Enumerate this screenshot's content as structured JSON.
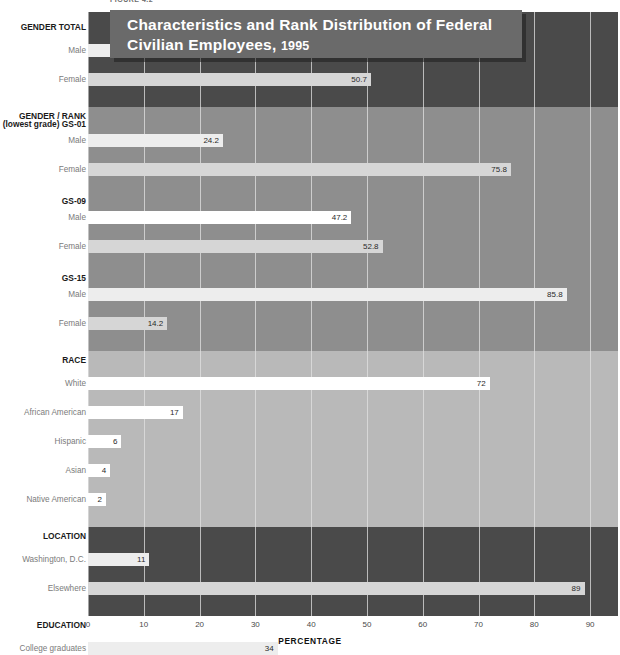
{
  "figure": {
    "label": "FIGURE 4.2",
    "title_line1": "Characteristics and Rank Distribution of Federal",
    "title_line2": "Civilian Employees,",
    "title_year": "1995"
  },
  "axis": {
    "title": "PERCENTAGE",
    "ticks": [
      "0",
      "10",
      "20",
      "30",
      "40",
      "50",
      "60",
      "70",
      "80",
      "90"
    ],
    "min": 0,
    "max": 95
  },
  "colors": {
    "band_dark": "#4a4a4a",
    "band_medium": "#8e8e8e",
    "band_light": "#b9b9b9",
    "bar_light": "#ededed",
    "bar_white": "#ffffff",
    "bar_pale": "#d6d6d6",
    "title_banner": "#6a6a6a",
    "title_text": "#ffffff",
    "label_text": "#7b7b7b",
    "group_text": "#1a1a1a"
  },
  "chart_data": {
    "type": "bar",
    "orientation": "horizontal",
    "title": "Characteristics and Rank Distribution of Federal Civilian Employees, 1995",
    "xlabel": "PERCENTAGE",
    "ylabel": "",
    "xlim": [
      0,
      95
    ],
    "grid": true,
    "legend": "none",
    "xticks": [
      0,
      10,
      20,
      30,
      40,
      50,
      60,
      70,
      80,
      90
    ],
    "groups": [
      {
        "name": "GENDER TOTAL",
        "band": "dark",
        "rows": [
          {
            "label": "Male",
            "value": 49.3,
            "display": "49.3",
            "shade": "light"
          },
          {
            "label": "Female",
            "value": 50.7,
            "display": "50.7",
            "shade": "pale"
          }
        ]
      },
      {
        "name": "GENDER / RANK",
        "band": "medium",
        "subgroups": [
          {
            "name": "(lowest grade) GS-01",
            "rows": [
              {
                "label": "Male",
                "value": 24.2,
                "display": "24.2",
                "shade": "light"
              },
              {
                "label": "Female",
                "value": 75.8,
                "display": "75.8",
                "shade": "pale"
              }
            ]
          },
          {
            "name": "GS-09",
            "rows": [
              {
                "label": "Male",
                "value": 47.2,
                "display": "47.2",
                "shade": "white"
              },
              {
                "label": "Female",
                "value": 52.8,
                "display": "52.8",
                "shade": "pale"
              }
            ]
          },
          {
            "name": "GS-15",
            "rows": [
              {
                "label": "Male",
                "value": 85.8,
                "display": "85.8",
                "shade": "light"
              },
              {
                "label": "Female",
                "value": 14.2,
                "display": "14.2",
                "shade": "pale"
              }
            ]
          }
        ]
      },
      {
        "name": "RACE",
        "band": "light",
        "rows": [
          {
            "label": "White",
            "value": 72,
            "display": "72",
            "shade": "white"
          },
          {
            "label": "African American",
            "value": 17,
            "display": "17",
            "shade": "white"
          },
          {
            "label": "Hispanic",
            "value": 6,
            "display": "6",
            "shade": "white"
          },
          {
            "label": "Asian",
            "value": 4,
            "display": "4",
            "shade": "white"
          },
          {
            "label": "Native American",
            "value": 2,
            "display": "2",
            "shade": "white"
          }
        ]
      },
      {
        "name": "LOCATION",
        "band": "dark",
        "rows": [
          {
            "label": "Washington, D.C.",
            "value": 11,
            "display": "11",
            "shade": "light"
          },
          {
            "label": "Elsewhere",
            "value": 89,
            "display": "89",
            "shade": "pale"
          }
        ]
      },
      {
        "name": "EDUCATION",
        "band": "medium",
        "rows": [
          {
            "label": "College graduates",
            "value": 34,
            "display": "34",
            "shade": "light"
          }
        ]
      }
    ]
  }
}
